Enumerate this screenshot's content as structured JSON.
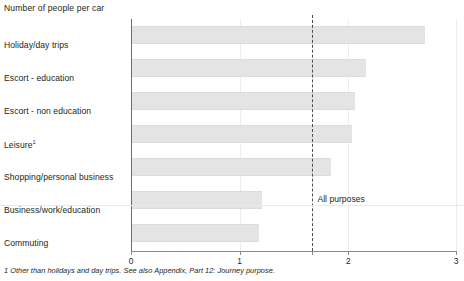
{
  "chart_data": {
    "type": "bar",
    "orientation": "horizontal",
    "title": "Number of people per car",
    "xlabel": "",
    "ylabel": "",
    "xlim": [
      0,
      3
    ],
    "xticks": [
      "0",
      "1",
      "2",
      "3"
    ],
    "xtick_values": [
      0,
      1,
      2,
      3
    ],
    "grid": true,
    "legend": null,
    "categories": [
      "Holiday/day trips",
      "Escort - education",
      "Escort - non education",
      "Leisure",
      "Shopping/personal business",
      "Business/work/education",
      "Commuting"
    ],
    "values": [
      2.7,
      2.15,
      2.05,
      2.02,
      1.83,
      1.2,
      1.17
    ],
    "annotations": [
      {
        "name": "all-purposes-reference",
        "label": "All purposes",
        "value": 1.67,
        "style": "dashed-vertical-line"
      }
    ]
  },
  "chart": {
    "title": "Number of people per car",
    "footnote": "1 Other than holidays and day trips. See also Appendix, Part 12: Journey purpose.",
    "reference_label": "All purposes",
    "category_labels": [
      {
        "text": "Holiday/day trips",
        "footnote_marker": ""
      },
      {
        "text": "Escort - education",
        "footnote_marker": ""
      },
      {
        "text": "Escort - non education",
        "footnote_marker": ""
      },
      {
        "text": "Leisure",
        "footnote_marker": "1"
      },
      {
        "text": "Shopping/personal business",
        "footnote_marker": ""
      },
      {
        "text": "Business/work/education",
        "footnote_marker": ""
      },
      {
        "text": "Commuting",
        "footnote_marker": ""
      }
    ],
    "tick_labels": [
      "0",
      "1",
      "2",
      "3"
    ],
    "colors": {
      "bar_fill": "#e4e4e4",
      "axis": "#6e6e6e",
      "grid": "#ededed",
      "reference_line": "#4d4d4d",
      "text": "#231f20"
    }
  }
}
